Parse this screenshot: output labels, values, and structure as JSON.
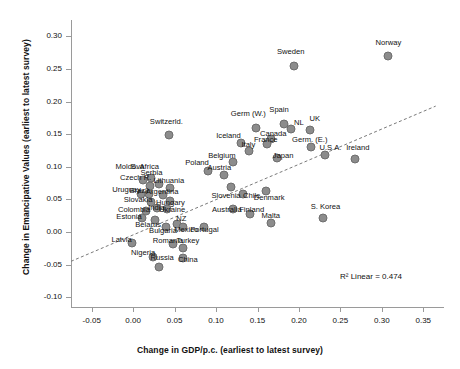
{
  "chart_data": {
    "type": "scatter",
    "title": "",
    "xlabel": "Change in GDP/p.c. (earliest to latest survey)",
    "ylabel": "Change in Emancipative Values (earliest to latest survey)",
    "xlim": [
      -0.075,
      0.375
    ],
    "ylim": [
      -0.115,
      0.325
    ],
    "xticks": [
      "-0.05",
      "0.00",
      "0.05",
      "0.10",
      "0.15",
      "0.20",
      "0.25",
      "0.30",
      "0.35"
    ],
    "xtick_values": [
      -0.05,
      0.0,
      0.05,
      0.1,
      0.15,
      0.2,
      0.25,
      0.3,
      0.35
    ],
    "yticks": [
      "0.30",
      "0.25",
      "0.20",
      "0.15",
      "0.10",
      "0.05",
      "0.00",
      "-0.05",
      "-0.10"
    ],
    "ytick_values": [
      0.3,
      0.25,
      0.2,
      0.15,
      0.1,
      0.05,
      0.0,
      -0.05,
      -0.1
    ],
    "grid": false,
    "legend": "none",
    "annotation": "R² Linear = 0.474",
    "marker_color": "#8c8c8c",
    "trendline": {
      "style": "dashed",
      "x0": -0.075,
      "y0": -0.045,
      "x1": 0.365,
      "y1": 0.193
    },
    "points": [
      {
        "label": "Norway",
        "x": 0.308,
        "y": 0.27,
        "lx": 0.308,
        "ly": 0.292
      },
      {
        "label": "Sweden",
        "x": 0.194,
        "y": 0.255,
        "lx": 0.19,
        "ly": 0.277
      },
      {
        "label": "Spain",
        "x": 0.182,
        "y": 0.166,
        "lx": 0.176,
        "ly": 0.188
      },
      {
        "label": "NL",
        "x": 0.19,
        "y": 0.158,
        "lx": 0.2,
        "ly": 0.168
      },
      {
        "label": "UK",
        "x": 0.213,
        "y": 0.157,
        "lx": 0.219,
        "ly": 0.175
      },
      {
        "label": "Germ (W.)",
        "x": 0.148,
        "y": 0.16,
        "lx": 0.139,
        "ly": 0.182
      },
      {
        "label": "Canada",
        "x": 0.166,
        "y": 0.143,
        "lx": 0.169,
        "ly": 0.151
      },
      {
        "label": "France",
        "x": 0.162,
        "y": 0.135,
        "lx": 0.16,
        "ly": 0.143
      },
      {
        "label": "Iceland",
        "x": 0.13,
        "y": 0.136,
        "lx": 0.115,
        "ly": 0.149
      },
      {
        "label": "Germ. (E.)",
        "x": 0.214,
        "y": 0.131,
        "lx": 0.213,
        "ly": 0.142
      },
      {
        "label": "Italy",
        "x": 0.14,
        "y": 0.124,
        "lx": 0.139,
        "ly": 0.135
      },
      {
        "label": "U.S.A.",
        "x": 0.231,
        "y": 0.118,
        "lx": 0.238,
        "ly": 0.13
      },
      {
        "label": "Ireland",
        "x": 0.268,
        "y": 0.112,
        "lx": 0.271,
        "ly": 0.13
      },
      {
        "label": "Japan",
        "x": 0.174,
        "y": 0.113,
        "lx": 0.181,
        "ly": 0.118
      },
      {
        "label": "Belgium",
        "x": 0.121,
        "y": 0.108,
        "lx": 0.107,
        "ly": 0.118
      },
      {
        "label": "Poland",
        "x": 0.09,
        "y": 0.093,
        "lx": 0.077,
        "ly": 0.107
      },
      {
        "label": "Austria",
        "x": 0.109,
        "y": 0.088,
        "lx": 0.104,
        "ly": 0.099
      },
      {
        "label": "Switzerld.",
        "x": 0.043,
        "y": 0.148,
        "lx": 0.04,
        "ly": 0.17
      },
      {
        "label": "S. Africa",
        "x": 0.022,
        "y": 0.083,
        "lx": 0.014,
        "ly": 0.101
      },
      {
        "label": "Moldova",
        "x": 0.012,
        "y": 0.079,
        "lx": -0.004,
        "ly": 0.101
      },
      {
        "label": "Serbia",
        "x": 0.031,
        "y": 0.074,
        "lx": 0.022,
        "ly": 0.092
      },
      {
        "label": "Czech R.",
        "x": 0.02,
        "y": 0.07,
        "lx": 0.003,
        "ly": 0.085
      },
      {
        "label": "Lithuania",
        "x": 0.044,
        "y": 0.068,
        "lx": 0.043,
        "ly": 0.08
      },
      {
        "label": "Slovenia",
        "x": 0.118,
        "y": 0.069,
        "lx": 0.112,
        "ly": 0.056
      },
      {
        "label": "Brazil",
        "x": 0.019,
        "y": 0.059,
        "lx": 0.007,
        "ly": 0.064
      },
      {
        "label": "Uruguay",
        "x": 0.009,
        "y": 0.059,
        "lx": -0.008,
        "ly": 0.066
      },
      {
        "label": "Argentina",
        "x": 0.036,
        "y": 0.057,
        "lx": 0.035,
        "ly": 0.063
      },
      {
        "label": "Chile",
        "x": 0.133,
        "y": 0.059,
        "lx": 0.143,
        "ly": 0.057
      },
      {
        "label": "Slovakia",
        "x": 0.022,
        "y": 0.046,
        "lx": 0.006,
        "ly": 0.05
      },
      {
        "label": "Hungary",
        "x": 0.044,
        "y": 0.047,
        "lx": 0.045,
        "ly": 0.046
      },
      {
        "label": "India",
        "x": 0.029,
        "y": 0.037,
        "lx": 0.028,
        "ly": 0.038
      },
      {
        "label": "Ukraine",
        "x": 0.041,
        "y": 0.035,
        "lx": 0.047,
        "ly": 0.035
      },
      {
        "label": "Colombia",
        "x": 0.016,
        "y": 0.032,
        "lx": 0.001,
        "ly": 0.036
      },
      {
        "label": "Australia",
        "x": 0.121,
        "y": 0.036,
        "lx": 0.113,
        "ly": 0.035
      },
      {
        "label": "Finland",
        "x": 0.141,
        "y": 0.028,
        "lx": 0.143,
        "ly": 0.035
      },
      {
        "label": "Estonia",
        "x": 0.011,
        "y": 0.022,
        "lx": -0.005,
        "ly": 0.025
      },
      {
        "label": "Belarus",
        "x": 0.026,
        "y": 0.019,
        "lx": 0.018,
        "ly": 0.012
      },
      {
        "label": "NZ",
        "x": 0.053,
        "y": 0.013,
        "lx": 0.058,
        "ly": 0.021
      },
      {
        "label": "Malta",
        "x": 0.166,
        "y": 0.014,
        "lx": 0.166,
        "ly": 0.026
      },
      {
        "label": "Denmark",
        "x": 0.16,
        "y": 0.063,
        "lx": 0.164,
        "ly": 0.053
      },
      {
        "label": "Bulgaria",
        "x": 0.04,
        "y": 0.007,
        "lx": 0.036,
        "ly": 0.003
      },
      {
        "label": "Mexico",
        "x": 0.06,
        "y": 0.008,
        "lx": 0.064,
        "ly": 0.004
      },
      {
        "label": "Portugal",
        "x": 0.086,
        "y": 0.008,
        "lx": 0.086,
        "ly": 0.004
      },
      {
        "label": "Latvia",
        "x": -0.002,
        "y": -0.017,
        "lx": -0.014,
        "ly": -0.011
      },
      {
        "label": "Romania",
        "x": 0.048,
        "y": -0.018,
        "lx": 0.042,
        "ly": -0.013
      },
      {
        "label": "Turkey",
        "x": 0.06,
        "y": -0.024,
        "lx": 0.066,
        "ly": -0.013
      },
      {
        "label": "S. Korea",
        "x": 0.229,
        "y": 0.022,
        "lx": 0.232,
        "ly": 0.04
      },
      {
        "label": "Nigeria",
        "x": 0.024,
        "y": -0.039,
        "lx": 0.012,
        "ly": -0.03
      },
      {
        "label": "Russia",
        "x": 0.031,
        "y": -0.053,
        "lx": 0.035,
        "ly": -0.038
      },
      {
        "label": "China",
        "x": 0.06,
        "y": -0.04,
        "lx": 0.066,
        "ly": -0.041
      }
    ]
  }
}
